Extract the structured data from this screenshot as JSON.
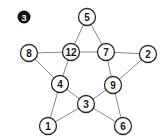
{
  "puzzle": {
    "badge": {
      "label": "3",
      "x": 24,
      "y": 17,
      "r": 6.5
    },
    "node_radius": 8.5,
    "nodes": [
      {
        "id": "n5",
        "label": "5",
        "x": 87,
        "y": 17
      },
      {
        "id": "n8",
        "label": "8",
        "x": 29,
        "y": 53
      },
      {
        "id": "n12",
        "label": "12",
        "x": 71,
        "y": 52
      },
      {
        "id": "n7",
        "label": "7",
        "x": 106,
        "y": 52
      },
      {
        "id": "n2",
        "label": "2",
        "x": 148,
        "y": 54
      },
      {
        "id": "n4",
        "label": "4",
        "x": 60,
        "y": 84
      },
      {
        "id": "n9",
        "label": "9",
        "x": 113,
        "y": 85
      },
      {
        "id": "n3",
        "label": "3",
        "x": 86,
        "y": 104
      },
      {
        "id": "n1",
        "label": "1",
        "x": 48,
        "y": 126
      },
      {
        "id": "n6",
        "label": "6",
        "x": 123,
        "y": 126
      }
    ],
    "edges": [
      [
        "n5",
        "n12"
      ],
      [
        "n5",
        "n7"
      ],
      [
        "n8",
        "n12"
      ],
      [
        "n12",
        "n7"
      ],
      [
        "n7",
        "n2"
      ],
      [
        "n8",
        "n4"
      ],
      [
        "n2",
        "n9"
      ],
      [
        "n12",
        "n4"
      ],
      [
        "n7",
        "n9"
      ],
      [
        "n4",
        "n3"
      ],
      [
        "n3",
        "n9"
      ],
      [
        "n4",
        "n1"
      ],
      [
        "n1",
        "n3"
      ],
      [
        "n9",
        "n6"
      ],
      [
        "n3",
        "n6"
      ]
    ]
  }
}
